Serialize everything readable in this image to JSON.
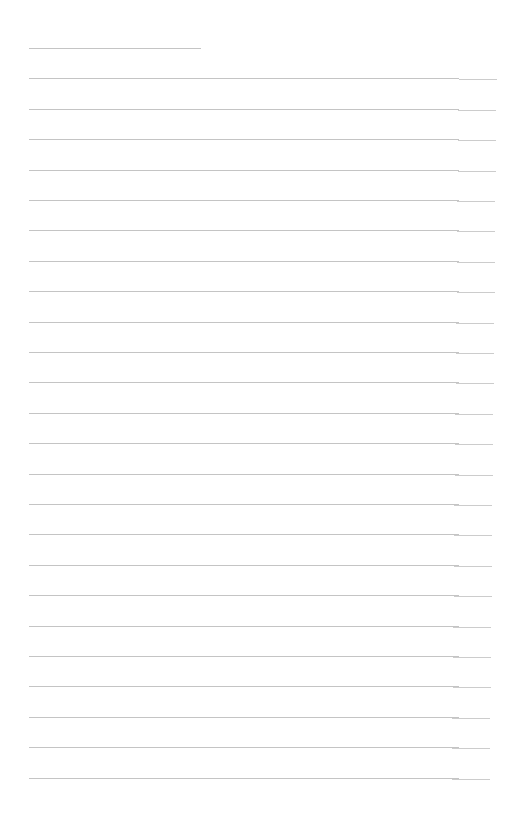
{
  "page": {
    "type": "lined-paper",
    "corner_mark": "",
    "line_color": "#c4c4c4",
    "background": "#ffffff",
    "line_count": 25,
    "first_line_top": 48,
    "line_spacing": 30.4,
    "lines": []
  }
}
